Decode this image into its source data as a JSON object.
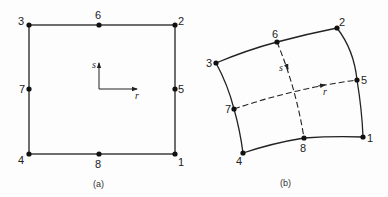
{
  "panels": [
    {
      "id": "a",
      "caption": "(a)",
      "shape": "square",
      "nodes": [
        {
          "id": "1",
          "label": "1",
          "x": 175,
          "y": 154
        },
        {
          "id": "2",
          "label": "2",
          "x": 175,
          "y": 25
        },
        {
          "id": "3",
          "label": "3",
          "x": 29,
          "y": 25
        },
        {
          "id": "4",
          "label": "4",
          "x": 29,
          "y": 154
        },
        {
          "id": "5",
          "label": "5",
          "x": 175,
          "y": 89
        },
        {
          "id": "6",
          "label": "6",
          "x": 99,
          "y": 25
        },
        {
          "id": "7",
          "label": "7",
          "x": 29,
          "y": 89
        },
        {
          "id": "8",
          "label": "8",
          "x": 99,
          "y": 154
        }
      ],
      "axes": {
        "r_label": "r",
        "s_label": "s"
      }
    },
    {
      "id": "b",
      "caption": "(b)",
      "shape": "distorted-curved-quadrilateral",
      "nodes": [
        {
          "id": "1",
          "label": "1",
          "x": 363,
          "y": 137
        },
        {
          "id": "2",
          "label": "2",
          "x": 337,
          "y": 28
        },
        {
          "id": "3",
          "label": "3",
          "x": 216,
          "y": 63
        },
        {
          "id": "4",
          "label": "4",
          "x": 243,
          "y": 153
        },
        {
          "id": "5",
          "label": "5",
          "x": 357,
          "y": 80
        },
        {
          "id": "6",
          "label": "6",
          "x": 277,
          "y": 42
        },
        {
          "id": "7",
          "label": "7",
          "x": 234,
          "y": 109
        },
        {
          "id": "8",
          "label": "8",
          "x": 304,
          "y": 138
        }
      ],
      "axes": {
        "r_label": "r",
        "s_label": "s"
      }
    }
  ]
}
